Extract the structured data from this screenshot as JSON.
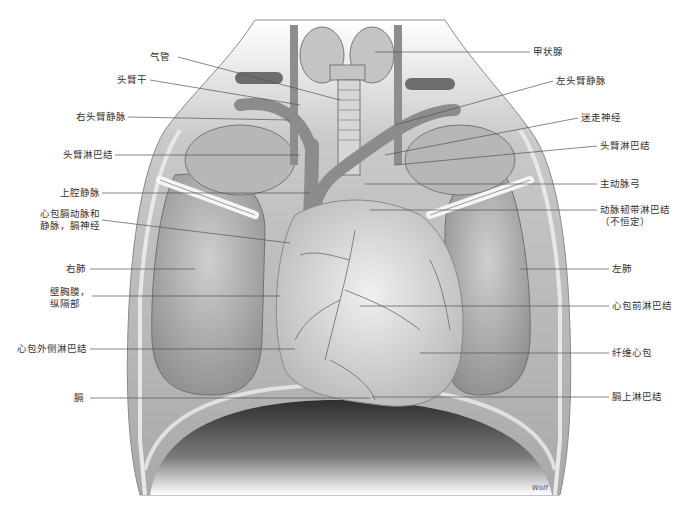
{
  "figure": {
    "signature": "Wolf",
    "labels_left": [
      {
        "id": "trachea",
        "text": "气管",
        "x": 192,
        "y": 57
      },
      {
        "id": "brachiocephalic-trunk",
        "text": "头臂干",
        "x": 145,
        "y": 80
      },
      {
        "id": "right-brachiocephalic-vein",
        "text": "右头臂静脉",
        "x": 77,
        "y": 117
      },
      {
        "id": "brachiocephalic-lymph-node-right",
        "text": "头臂淋巴结",
        "x": 63,
        "y": 155
      },
      {
        "id": "superior-vena-cava",
        "text": "上腔静脉",
        "x": 60,
        "y": 193
      },
      {
        "id": "pericardiacophrenic-artery-vein-phrenic-nerve",
        "text": "心包膈动脉和",
        "text2": "静脉，膈神经",
        "x": 40,
        "y": 213
      },
      {
        "id": "right-lung",
        "text": "右肺",
        "x": 66,
        "y": 269
      },
      {
        "id": "parietal-pleura-mediastinal",
        "text": "壁胸膜，",
        "text2": "纵隔部",
        "x": 50,
        "y": 291
      },
      {
        "id": "lateral-pericardial-lymph-nodes",
        "text": "心包外侧淋巴结",
        "x": 17,
        "y": 349
      },
      {
        "id": "diaphragm",
        "text": "膈",
        "x": 74,
        "y": 398
      }
    ],
    "labels_right": [
      {
        "id": "thyroid-gland",
        "text": "甲状腺",
        "x": 533,
        "y": 52
      },
      {
        "id": "left-brachiocephalic-vein",
        "text": "左头臂静脉",
        "x": 556,
        "y": 81
      },
      {
        "id": "vagus-nerve",
        "text": "迷走神经",
        "x": 581,
        "y": 118
      },
      {
        "id": "brachiocephalic-lymph-node-left",
        "text": "头臂淋巴结",
        "x": 600,
        "y": 146
      },
      {
        "id": "aortic-arch",
        "text": "主动脉弓",
        "x": 600,
        "y": 184
      },
      {
        "id": "ligamentum-arteriosum-lymph-node",
        "text": "动脉韧带淋巴结",
        "text2": "（不恒定）",
        "x": 600,
        "y": 210
      },
      {
        "id": "left-lung",
        "text": "左肺",
        "x": 612,
        "y": 269
      },
      {
        "id": "prepericardial-lymph-nodes",
        "text": "心包前淋巴结",
        "x": 612,
        "y": 306
      },
      {
        "id": "fibrous-pericardium",
        "text": "纤维心包",
        "x": 612,
        "y": 353
      },
      {
        "id": "superior-phrenic-lymph-nodes",
        "text": "膈上淋巴结",
        "x": 612,
        "y": 397
      }
    ]
  },
  "colors": {
    "background": "#ffffff",
    "label_text": "#333333",
    "leader_line": "#555555",
    "tissue_light": "#d8d8d8",
    "tissue_mid": "#a8a8a8",
    "tissue_dark": "#5a5a5a",
    "vessel": "#7a7a7a"
  }
}
